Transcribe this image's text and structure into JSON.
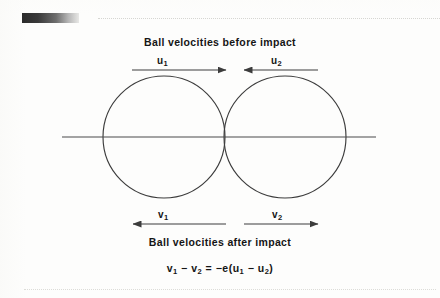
{
  "figure": {
    "caption_before": "Ball velocities before impact",
    "caption_after": "Ball velocities after impact",
    "equation_plain": "v1 - v2 = -e(u1 - u2)"
  },
  "labels": {
    "u1": {
      "symbol": "u",
      "sub": "1",
      "direction": "right"
    },
    "u2": {
      "symbol": "u",
      "sub": "2",
      "direction": "left"
    },
    "v1": {
      "symbol": "v",
      "sub": "1",
      "direction": "left"
    },
    "v2": {
      "symbol": "v",
      "sub": "2",
      "direction": "right"
    }
  },
  "equation": {
    "v": "v",
    "u": "u",
    "one": "1",
    "two": "2",
    "minus": "−",
    "equals": "=",
    "neg_e_open": "−e(",
    "close": ")"
  },
  "colors": {
    "ink": "#1a1a1a",
    "stroke": "#3c3c3c",
    "rule": "#d6d6d2",
    "page": "#fdfdfc",
    "swatch_dark": "#2b2b2b",
    "swatch_light": "#e8e8e6"
  },
  "geometry": {
    "circle_left": {
      "cx": 164,
      "cy": 137,
      "r": 61
    },
    "circle_right": {
      "cx": 285,
      "cy": 137,
      "r": 61
    },
    "axis_line": {
      "x1": 62,
      "y1": 137,
      "x2": 376,
      "y2": 137
    },
    "arrow_u1": {
      "x1": 132,
      "y1": 70,
      "x2": 226,
      "y2": 70,
      "head": "right"
    },
    "arrow_u2": {
      "x1": 318,
      "y1": 70,
      "x2": 244,
      "y2": 70,
      "head": "left"
    },
    "arrow_v1": {
      "x1": 226,
      "y1": 224,
      "x2": 133,
      "y2": 224,
      "head": "left"
    },
    "arrow_v2": {
      "x1": 244,
      "y1": 224,
      "x2": 318,
      "y2": 224,
      "head": "right"
    }
  }
}
